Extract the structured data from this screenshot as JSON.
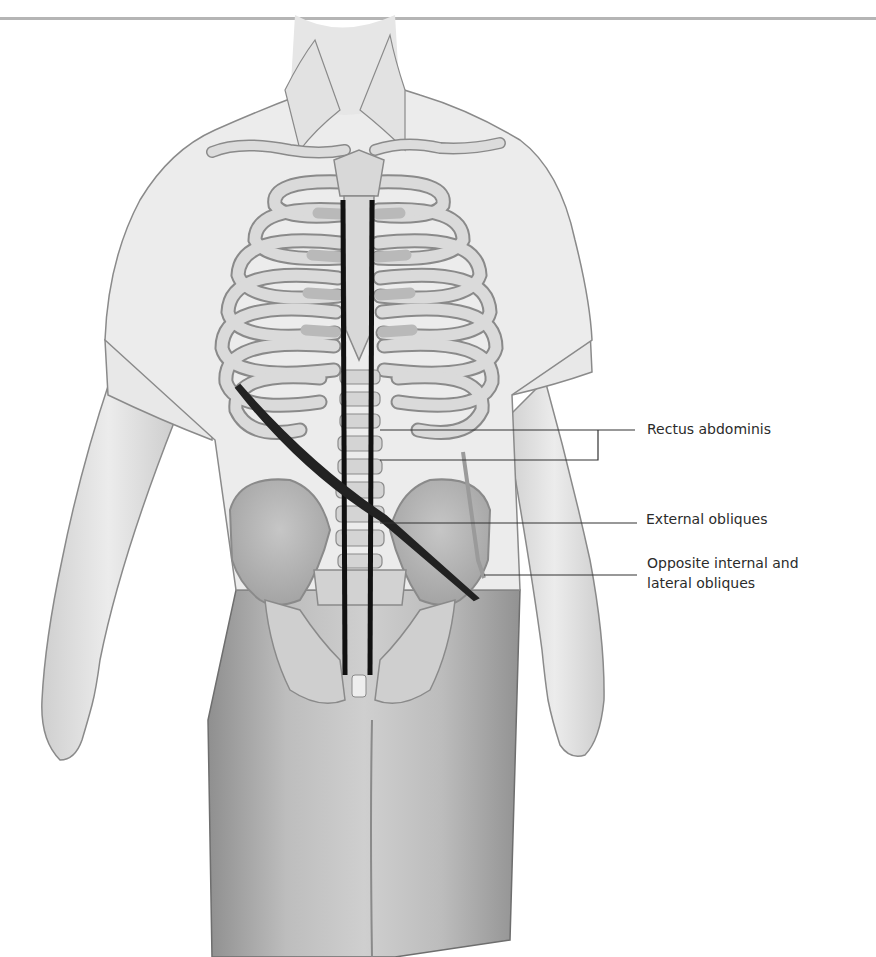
{
  "page": {
    "header_text": "CORE / ABDOMINAL",
    "header_rule_color": "#b5b5b5"
  },
  "figure": {
    "colors": {
      "skin": "#e4e4e4",
      "shirt": "#ececec",
      "bone": "#d9d9d9",
      "bone_outline": "#8a8a8a",
      "cartilage": "#b9b9b9",
      "trousers": "#a9a9a9",
      "muscle_line": "#111111",
      "leader_line": "#333333"
    },
    "labels": [
      {
        "id": "rectus-abdominis",
        "text": "Rectus abdominis"
      },
      {
        "id": "external-obliques",
        "text": "External obliques"
      },
      {
        "id": "opposite-internal-lateral-obliques",
        "line1": "Opposite internal and",
        "line2": "lateral obliques"
      }
    ]
  }
}
